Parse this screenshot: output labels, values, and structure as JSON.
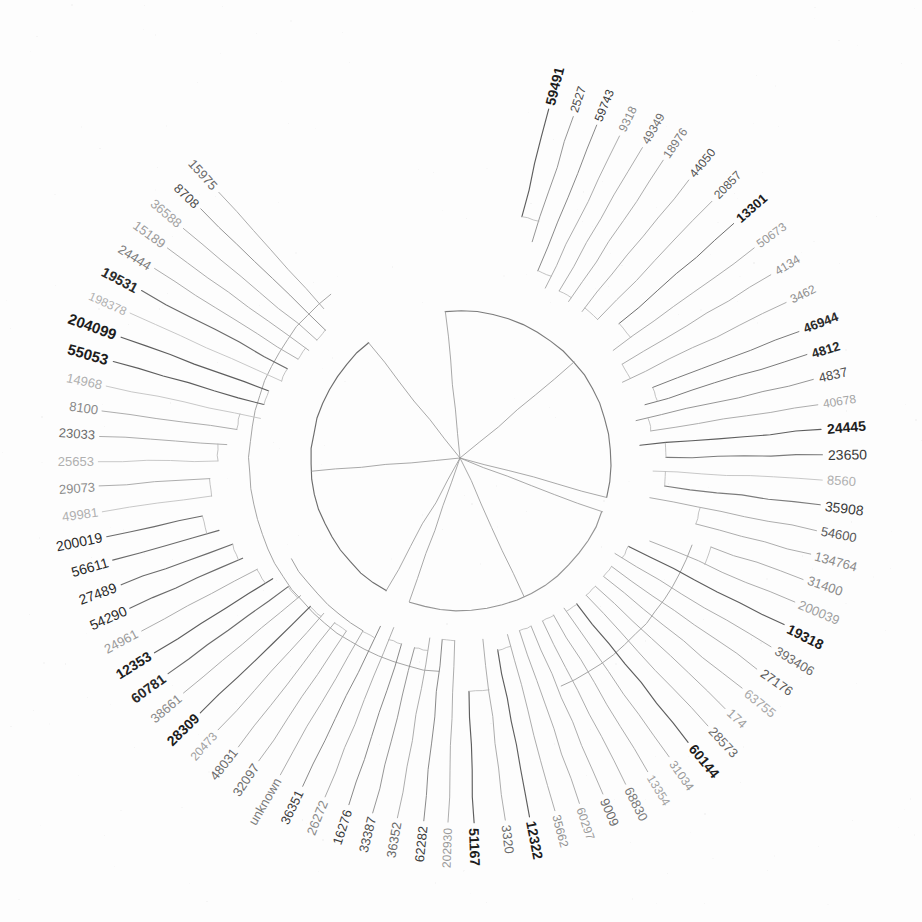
{
  "figure": {
    "kind": "circular-phylogenetic-tree",
    "style": "scanned grayscale radial cladogram, unrooted circular layout",
    "root": {
      "x": 460,
      "y": 458
    },
    "center": {
      "x": 461,
      "y": 461
    },
    "inner_radius": 150,
    "tip_radius": 362,
    "background_color": "#fdfdfd",
    "line_color": "#6a6a6a"
  },
  "chart_data": {
    "type": "tree",
    "title": "",
    "leaf_count": 88,
    "angle_start_deg": -96,
    "angle_sweep_deg": 360,
    "leaves": [
      {
        "label": "59491",
        "angle": -76,
        "weight": "bold",
        "shade": "#1d1d1d",
        "size": 14,
        "depth": 0.52
      },
      {
        "label": "2527",
        "angle": -72,
        "weight": "normal",
        "shade": "#4a4a4a",
        "size": 12,
        "depth": 0.62
      },
      {
        "label": "59743",
        "angle": -68,
        "weight": "normal",
        "shade": "#3a3a3a",
        "size": 12,
        "depth": 0.74
      },
      {
        "label": "9318",
        "angle": -64,
        "weight": "normal",
        "shade": "#8a8a8a",
        "size": 12,
        "depth": 0.8
      },
      {
        "label": "49349",
        "angle": -60,
        "weight": "normal",
        "shade": "#6e6e6e",
        "size": 12,
        "depth": 0.78
      },
      {
        "label": "18976",
        "angle": -56,
        "weight": "normal",
        "shade": "#7c7c7c",
        "size": 12,
        "depth": 0.8
      },
      {
        "label": "44050",
        "angle": -51,
        "weight": "normal",
        "shade": "#4f4f4f",
        "size": 12,
        "depth": 0.8
      },
      {
        "label": "20857",
        "angle": -46,
        "weight": "normal",
        "shade": "#5a5a5a",
        "size": 12,
        "depth": 0.78
      },
      {
        "label": "13301",
        "angle": -41,
        "weight": "bold",
        "shade": "#1d1d1d",
        "size": 13,
        "depth": 0.72
      },
      {
        "label": "50673",
        "angle": -36,
        "weight": "normal",
        "shade": "#9a9a9a",
        "size": 12,
        "depth": 0.82
      },
      {
        "label": "4134",
        "angle": -31,
        "weight": "normal",
        "shade": "#8e8e8e",
        "size": 12,
        "depth": 0.82
      },
      {
        "label": "3462",
        "angle": -26,
        "weight": "normal",
        "shade": "#8e8e8e",
        "size": 12,
        "depth": 0.86
      },
      {
        "label": "46944",
        "angle": -21,
        "weight": "bold",
        "shade": "#2a2a2a",
        "size": 13,
        "depth": 0.74
      },
      {
        "label": "4812",
        "angle": -17,
        "weight": "bold",
        "shade": "#2a2a2a",
        "size": 13,
        "depth": 0.8
      },
      {
        "label": "4837",
        "angle": -13,
        "weight": "normal",
        "shade": "#4a4a4a",
        "size": 13,
        "depth": 0.86
      },
      {
        "label": "40678",
        "angle": -9,
        "weight": "normal",
        "shade": "#a4a4a4",
        "size": 12,
        "depth": 0.8
      },
      {
        "label": "24445",
        "angle": -5,
        "weight": "bold",
        "shade": "#1d1d1d",
        "size": 14,
        "depth": 0.86
      },
      {
        "label": "23650",
        "angle": -1,
        "weight": "normal",
        "shade": "#3a3a3a",
        "size": 14,
        "depth": 0.74
      },
      {
        "label": "8560",
        "angle": 3,
        "weight": "normal",
        "shade": "#b0b0b0",
        "size": 13,
        "depth": 0.8
      },
      {
        "label": "35908",
        "angle": 7,
        "weight": "normal",
        "shade": "#3a3a3a",
        "size": 14,
        "depth": 0.74
      },
      {
        "label": "54600",
        "angle": 11,
        "weight": "normal",
        "shade": "#5a5a5a",
        "size": 13,
        "depth": 0.8
      },
      {
        "label": "134764",
        "angle": 15,
        "weight": "normal",
        "shade": "#8a8a8a",
        "size": 13,
        "depth": 0.56
      },
      {
        "label": "31400",
        "angle": 19,
        "weight": "normal",
        "shade": "#8a8a8a",
        "size": 13,
        "depth": 0.46
      },
      {
        "label": "200039",
        "angle": 23,
        "weight": "normal",
        "shade": "#a0a0a0",
        "size": 13,
        "depth": 0.74
      },
      {
        "label": "19318",
        "angle": 27,
        "weight": "bold",
        "shade": "#1d1d1d",
        "size": 14,
        "depth": 0.82
      },
      {
        "label": "393406",
        "angle": 31,
        "weight": "normal",
        "shade": "#6a6a6a",
        "size": 13,
        "depth": 0.86
      },
      {
        "label": "27176",
        "angle": 35,
        "weight": "normal",
        "shade": "#5a5a5a",
        "size": 13,
        "depth": 0.84
      },
      {
        "label": "63755",
        "angle": 39,
        "weight": "normal",
        "shade": "#a8a8a8",
        "size": 13,
        "depth": 0.84
      },
      {
        "label": "174",
        "angle": 43,
        "weight": "normal",
        "shade": "#a0a0a0",
        "size": 13,
        "depth": 0.84
      },
      {
        "label": "28573",
        "angle": 47,
        "weight": "normal",
        "shade": "#6a6a6a",
        "size": 13,
        "depth": 0.84
      },
      {
        "label": "60144",
        "angle": 51,
        "weight": "bold",
        "shade": "#1d1d1d",
        "size": 14,
        "depth": 0.84
      },
      {
        "label": "31034",
        "angle": 55,
        "weight": "normal",
        "shade": "#9a9a9a",
        "size": 12,
        "depth": 0.86
      },
      {
        "label": "13354",
        "angle": 59,
        "weight": "normal",
        "shade": "#a4a4a4",
        "size": 12,
        "depth": 0.86
      },
      {
        "label": "68830",
        "angle": 63,
        "weight": "normal",
        "shade": "#7a7a7a",
        "size": 13,
        "depth": 0.86
      },
      {
        "label": "9009",
        "angle": 67,
        "weight": "normal",
        "shade": "#6a6a6a",
        "size": 13,
        "depth": 0.86
      },
      {
        "label": "60297",
        "angle": 71,
        "weight": "normal",
        "shade": "#9a9a9a",
        "size": 12,
        "depth": 0.86
      },
      {
        "label": "35662",
        "angle": 75,
        "weight": "normal",
        "shade": "#8e8e8e",
        "size": 12,
        "depth": 0.86
      },
      {
        "label": "12322",
        "angle": 79,
        "weight": "bold",
        "shade": "#1d1d1d",
        "size": 14,
        "depth": 0.8
      },
      {
        "label": "3320",
        "angle": 83,
        "weight": "normal",
        "shade": "#6a6a6a",
        "size": 13,
        "depth": 0.86
      },
      {
        "label": "51167",
        "angle": 88,
        "weight": "bold",
        "shade": "#1d1d1d",
        "size": 14,
        "depth": 0.62
      },
      {
        "label": "202930",
        "angle": 92,
        "weight": "normal",
        "shade": "#9a9a9a",
        "size": 12,
        "depth": 0.86
      },
      {
        "label": "62282",
        "angle": 96,
        "weight": "normal",
        "shade": "#3a3a3a",
        "size": 13,
        "depth": 0.86
      },
      {
        "label": "36352",
        "angle": 100,
        "weight": "normal",
        "shade": "#6a6a6a",
        "size": 13,
        "depth": 0.86
      },
      {
        "label": "33387",
        "angle": 104,
        "weight": "normal",
        "shade": "#4a4a4a",
        "size": 13,
        "depth": 0.8
      },
      {
        "label": "16276",
        "angle": 108,
        "weight": "normal",
        "shade": "#3a3a3a",
        "size": 13,
        "depth": 0.8
      },
      {
        "label": "26272",
        "angle": 112,
        "weight": "normal",
        "shade": "#8a8a8a",
        "size": 13,
        "depth": 0.86
      },
      {
        "label": "36351",
        "angle": 116,
        "weight": "normal",
        "shade": "#3a3a3a",
        "size": 13,
        "depth": 0.84
      },
      {
        "label": "unknown",
        "angle": 120,
        "weight": "normal",
        "shade": "#7a7a7a",
        "size": 13,
        "depth": 0.78
      },
      {
        "label": "32097",
        "angle": 124,
        "weight": "normal",
        "shade": "#6a6a6a",
        "size": 13,
        "depth": 0.74
      },
      {
        "label": "48031",
        "angle": 128,
        "weight": "normal",
        "shade": "#6a6a6a",
        "size": 13,
        "depth": 0.74
      },
      {
        "label": "20473",
        "angle": 132,
        "weight": "normal",
        "shade": "#a0a0a0",
        "size": 12,
        "depth": 0.74
      },
      {
        "label": "28309",
        "angle": 136,
        "weight": "bold",
        "shade": "#1d1d1d",
        "size": 14,
        "depth": 0.72
      },
      {
        "label": "38661",
        "angle": 140,
        "weight": "normal",
        "shade": "#8a8a8a",
        "size": 13,
        "depth": 0.72
      },
      {
        "label": "60781",
        "angle": 144,
        "weight": "bold",
        "shade": "#2a2a2a",
        "size": 14,
        "depth": 0.7
      },
      {
        "label": "12353",
        "angle": 148,
        "weight": "bold",
        "shade": "#1d1d1d",
        "size": 14,
        "depth": 0.66
      },
      {
        "label": "24961",
        "angle": 152,
        "weight": "normal",
        "shade": "#9a9a9a",
        "size": 13,
        "depth": 0.62
      },
      {
        "label": "54290",
        "angle": 156,
        "weight": "normal",
        "shade": "#2a2a2a",
        "size": 14,
        "depth": 0.58
      },
      {
        "label": "27489",
        "angle": 160,
        "weight": "normal",
        "shade": "#2a2a2a",
        "size": 14,
        "depth": 0.56
      },
      {
        "label": "56611",
        "angle": 164,
        "weight": "normal",
        "shade": "#2a2a2a",
        "size": 14,
        "depth": 0.52
      },
      {
        "label": "200019",
        "angle": 168,
        "weight": "normal",
        "shade": "#2a2a2a",
        "size": 14,
        "depth": 0.46
      },
      {
        "label": "49981",
        "angle": 172,
        "weight": "normal",
        "shade": "#b0b0b0",
        "size": 13,
        "depth": 0.52
      },
      {
        "label": "29073",
        "angle": 176,
        "weight": "normal",
        "shade": "#8a8a8a",
        "size": 13,
        "depth": 0.52
      },
      {
        "label": "25653",
        "angle": 180,
        "weight": "normal",
        "shade": "#b0b0b0",
        "size": 13,
        "depth": 0.56
      },
      {
        "label": "23033",
        "angle": 184,
        "weight": "normal",
        "shade": "#6a6a6a",
        "size": 13,
        "depth": 0.6
      },
      {
        "label": "8100",
        "angle": 188,
        "weight": "normal",
        "shade": "#8a8a8a",
        "size": 13,
        "depth": 0.64
      },
      {
        "label": "14968",
        "angle": 192,
        "weight": "normal",
        "shade": "#b0b0b0",
        "size": 13,
        "depth": 0.74
      },
      {
        "label": "55053",
        "angle": 196,
        "weight": "bold",
        "shade": "#1d1d1d",
        "size": 15,
        "depth": 0.74
      },
      {
        "label": "204099",
        "angle": 200,
        "weight": "bold",
        "shade": "#1d1d1d",
        "size": 15,
        "depth": 0.74
      },
      {
        "label": "198378",
        "angle": 204,
        "weight": "normal",
        "shade": "#b0b0b0",
        "size": 12,
        "depth": 0.78
      },
      {
        "label": "19531",
        "angle": 208,
        "weight": "bold",
        "shade": "#2a2a2a",
        "size": 14,
        "depth": 0.78
      },
      {
        "label": "24444",
        "angle": 212,
        "weight": "normal",
        "shade": "#7a7a7a",
        "size": 13,
        "depth": 0.8
      },
      {
        "label": "15189",
        "angle": 216,
        "weight": "normal",
        "shade": "#9a9a9a",
        "size": 13,
        "depth": 0.82
      },
      {
        "label": "36588",
        "angle": 220,
        "weight": "normal",
        "shade": "#a4a4a4",
        "size": 13,
        "depth": 0.82
      },
      {
        "label": "8708",
        "angle": 224,
        "weight": "normal",
        "shade": "#4a4a4a",
        "size": 13,
        "depth": 0.82
      },
      {
        "label": "15975",
        "angle": 228,
        "weight": "normal",
        "shade": "#6a6a6a",
        "size": 13,
        "depth": 0.74
      }
    ],
    "internal_nodes": [
      {
        "id": "root",
        "radius": 0,
        "angle_from": -96,
        "angle_to": 264
      },
      {
        "id": "cladeA",
        "radius": 150,
        "angle_from": -96,
        "angle_to": 14
      },
      {
        "id": "cladeB",
        "radius": 150,
        "angle_from": 20,
        "angle_to": 110
      },
      {
        "id": "cladeC",
        "radius": 150,
        "angle_from": 120,
        "angle_to": 232
      }
    ]
  }
}
